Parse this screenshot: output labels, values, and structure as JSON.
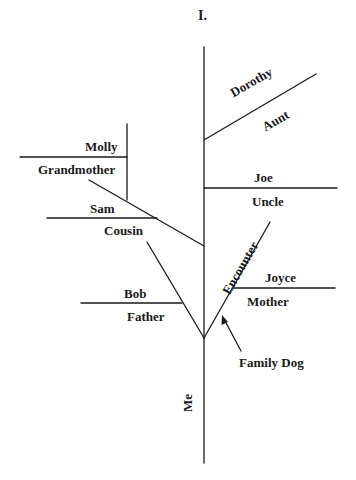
{
  "title": "I.",
  "colors": {
    "line": "#1a1a1a",
    "text": "#1a1a1a",
    "background": "#ffffff"
  },
  "diagram": {
    "root": "Me",
    "branches": [
      {
        "name": "Dorothy",
        "relation": "Aunt"
      },
      {
        "name": "Molly",
        "relation": "Grandmother"
      },
      {
        "name": "Joe",
        "relation": "Uncle"
      },
      {
        "name": "Sam",
        "relation": "Cousin"
      },
      {
        "name": "Joyce",
        "relation": "Mother"
      },
      {
        "name": "Bob",
        "relation": "Father"
      }
    ],
    "encounter": "Encounter",
    "annotation": "Family Dog"
  }
}
